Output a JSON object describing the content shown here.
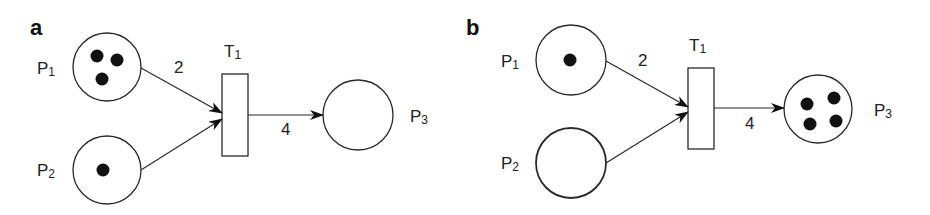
{
  "panels": [
    {
      "label": "a",
      "places": [
        {
          "name": "P",
          "sub": "1",
          "tokens": 3
        },
        {
          "name": "P",
          "sub": "2",
          "tokens": 1
        },
        {
          "name": "P",
          "sub": "3",
          "tokens": 0
        }
      ],
      "transition": {
        "name": "T",
        "sub": "1"
      },
      "arcs": [
        {
          "from": "P1",
          "to": "T1",
          "weight": "2"
        },
        {
          "from": "P2",
          "to": "T1",
          "weight": ""
        },
        {
          "from": "T1",
          "to": "P3",
          "weight": "4"
        }
      ]
    },
    {
      "label": "b",
      "places": [
        {
          "name": "P",
          "sub": "1",
          "tokens": 1
        },
        {
          "name": "P",
          "sub": "2",
          "tokens": 0
        },
        {
          "name": "P",
          "sub": "3",
          "tokens": 4
        }
      ],
      "transition": {
        "name": "T",
        "sub": "1"
      },
      "arcs": [
        {
          "from": "P1",
          "to": "T1",
          "weight": "2"
        },
        {
          "from": "P2",
          "to": "T1",
          "weight": ""
        },
        {
          "from": "T1",
          "to": "P3",
          "weight": "4"
        }
      ]
    }
  ]
}
